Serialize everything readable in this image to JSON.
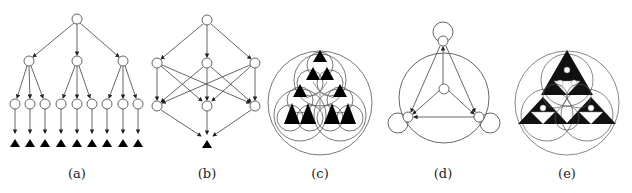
{
  "figure": {
    "panels": [
      {
        "id": "a",
        "label": "(a)",
        "description": "Hierarchical tree: 1 root, 3 children, 9 grandchildren, each pointing to a black triangle terminal"
      },
      {
        "id": "b",
        "label": "(b)",
        "description": "Layered graph: 1 root, 3 middle nodes fully connected to 3 lower nodes, converging to one black triangle"
      },
      {
        "id": "c",
        "label": "(c)",
        "description": "Circle packing with Sierpinski-like black triangles (level 2)"
      },
      {
        "id": "d",
        "label": "(d)",
        "description": "Directed graph: 3 outer nodes with self-loops, 1 center node, enclosing circle arcs"
      },
      {
        "id": "e",
        "label": "(e)",
        "description": "Circle packing with deeper Sierpinski triangle pattern (level 4)"
      }
    ],
    "colors": {
      "stroke": "#555555",
      "fill": "#000000",
      "node_fill": "#ffffff"
    }
  }
}
